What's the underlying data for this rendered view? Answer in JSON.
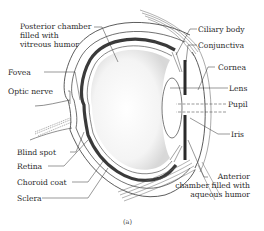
{
  "diagram": {
    "type": "anatomical-cross-section",
    "caption": "(a)",
    "labels_left": [
      {
        "id": "posterior-chamber",
        "text": [
          "Posterior chamber",
          "filled with",
          "vitreous humor"
        ]
      },
      {
        "id": "fovea",
        "text": [
          "Fovea"
        ]
      },
      {
        "id": "optic-nerve",
        "text": [
          "Optic nerve"
        ]
      },
      {
        "id": "blind-spot",
        "text": [
          "Blind spot"
        ]
      },
      {
        "id": "retina",
        "text": [
          "Retina"
        ]
      },
      {
        "id": "choroid-coat",
        "text": [
          "Choroid coat"
        ]
      },
      {
        "id": "sclera",
        "text": [
          "Sclera"
        ]
      }
    ],
    "labels_right": [
      {
        "id": "ciliary-body",
        "text": [
          "Ciliary body"
        ]
      },
      {
        "id": "conjunctiva",
        "text": [
          "Conjunctiva"
        ]
      },
      {
        "id": "cornea",
        "text": [
          "Cornea"
        ]
      },
      {
        "id": "lens",
        "text": [
          "Lens"
        ]
      },
      {
        "id": "pupil",
        "text": [
          "Pupil"
        ]
      },
      {
        "id": "iris",
        "text": [
          "Iris"
        ]
      },
      {
        "id": "anterior-chamber",
        "text": [
          "Anterior",
          "chamber filled with",
          "aqueous humor"
        ]
      }
    ],
    "colors": {
      "ink": "#2a2a2a",
      "choroid": "#3a3a3a",
      "background": "#ffffff"
    }
  }
}
